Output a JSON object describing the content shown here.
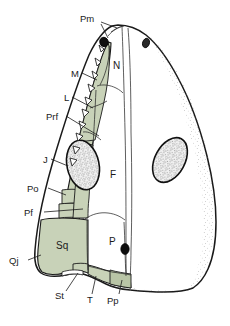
{
  "figure": {
    "type": "anatomical-diagram",
    "colors": {
      "background": "#ffffff",
      "outline": "#1a1a1a",
      "shaded_bone": "#c8d2b8",
      "shaded_bone_dark": "#b9c5a6",
      "unshaded_bone": "#ffffff",
      "fenestra_fill": "#efefef",
      "stipple": "#555555",
      "naris_fill": "#111111"
    },
    "labels_left": [
      {
        "id": "Pm",
        "text": "Pm",
        "x": 84,
        "y": 18
      },
      {
        "id": "M",
        "text": "M",
        "x": 71,
        "y": 73
      },
      {
        "id": "L",
        "text": "L",
        "x": 65,
        "y": 97
      },
      {
        "id": "Prf",
        "text": "Prf",
        "x": 48,
        "y": 116
      },
      {
        "id": "J",
        "text": "J",
        "x": 44,
        "y": 160
      },
      {
        "id": "Po",
        "text": "Po",
        "x": 30,
        "y": 190
      },
      {
        "id": "Pf",
        "text": "Pf",
        "x": 26,
        "y": 213
      },
      {
        "id": "Qj",
        "text": "Qj",
        "x": 12,
        "y": 262
      }
    ],
    "labels_bottom": [
      {
        "id": "St",
        "text": "St",
        "x": 58,
        "y": 296
      },
      {
        "id": "T",
        "text": "T",
        "x": 88,
        "y": 300
      },
      {
        "id": "Pp",
        "text": "Pp",
        "x": 110,
        "y": 301
      }
    ],
    "labels_inner": [
      {
        "id": "N",
        "text": "N",
        "x": 116,
        "y": 65
      },
      {
        "id": "F",
        "text": "F",
        "x": 113,
        "y": 174
      },
      {
        "id": "Sq",
        "text": "Sq",
        "x": 61,
        "y": 245
      },
      {
        "id": "P",
        "text": "P",
        "x": 112,
        "y": 241
      }
    ],
    "features": {
      "pineal_foramen": {
        "cx": 125,
        "cy": 249,
        "rx": 4,
        "ry": 5.2
      },
      "naris_left": {
        "cx": 104,
        "cy": 42,
        "rx": 4.2,
        "ry": 4.6
      },
      "naris_right": {
        "cx": 146,
        "cy": 43,
        "rx": 3.6,
        "ry": 4.6
      },
      "orbit_left": {
        "cx": 83,
        "cy": 165,
        "rx": 16,
        "ry": 25,
        "rot": -12
      },
      "orbit_right": {
        "cx": 170,
        "cy": 160,
        "rx": 15,
        "ry": 24,
        "rot": 28
      },
      "marginal_teeth_count": 12
    }
  }
}
